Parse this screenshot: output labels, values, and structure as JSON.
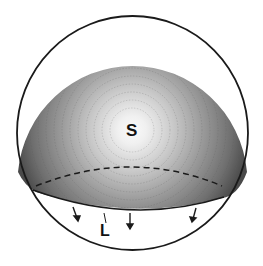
{
  "figure": {
    "labels": {
      "center": "S",
      "edge": "L"
    },
    "colors": {
      "outline": "#1a1a1a",
      "shading_dark": "#3a3a3a",
      "shading_light": "#f2f2f2",
      "background": "#ffffff"
    },
    "arrow_count": 4
  }
}
